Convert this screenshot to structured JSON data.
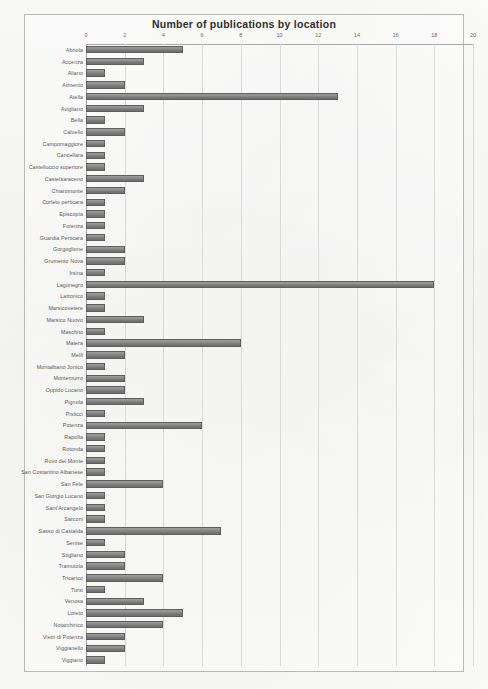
{
  "chart_data": {
    "type": "bar",
    "orientation": "horizontal",
    "title": "Number of publications by location",
    "xlabel": "",
    "ylabel": "",
    "xlim": [
      0,
      20
    ],
    "xticks": [
      0,
      2,
      4,
      6,
      8,
      10,
      12,
      14,
      16,
      18,
      20
    ],
    "grid": true,
    "legend": "none",
    "bar_color": "#8a8a8a",
    "categories": [
      "Abriola",
      "Accenza",
      "Aliano",
      "Armento",
      "Atella",
      "Avigliano",
      "Bella",
      "Calvello",
      "Campomaggiore",
      "Cancellara",
      "Castelluccio superiore",
      "Castelsaraceno",
      "Chiaromonte",
      "Corleto perticara",
      "Episcopia",
      "Forenza",
      "Guardia Perticara",
      "Gorgoglione",
      "Grumento Nova",
      "Irsina",
      "Lagonegro",
      "Latronico",
      "Marsicovetere",
      "Marsico Nuovo",
      "Maschito",
      "Matera",
      "Melfi",
      "Montalbano Jonico",
      "Montemurro",
      "Oppido Lucano",
      "Pignola",
      "Pisticci",
      "Potenza",
      "Rapolla",
      "Rotonda",
      "Ruvo del Monte",
      "San Costantino Albanese",
      "San Fele",
      "San Giorgio Lucano",
      "Sant'Arcangelo",
      "Sarconi",
      "Sasso di Castalda",
      "Senise",
      "Stigliano",
      "Tramutola",
      "Tricarico",
      "Tursi",
      "Venosa",
      "Loreto",
      "Notarchirico",
      "Vietri di Potenza",
      "Viggianello",
      "Viggiano"
    ],
    "values": [
      5,
      3,
      1,
      2,
      13,
      3,
      1,
      2,
      1,
      1,
      1,
      3,
      2,
      1,
      1,
      1,
      1,
      2,
      2,
      1,
      18,
      1,
      1,
      3,
      1,
      8,
      2,
      1,
      2,
      2,
      3,
      1,
      6,
      1,
      1,
      1,
      1,
      4,
      1,
      1,
      1,
      7,
      1,
      2,
      2,
      4,
      1,
      3,
      5,
      4,
      2,
      2,
      1
    ]
  }
}
